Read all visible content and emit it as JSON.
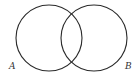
{
  "diagram": {
    "type": "venn",
    "sets": [
      {
        "label": "A",
        "cx": 49,
        "cy": 38,
        "r": 33,
        "label_x": 9,
        "label_y": 69
      },
      {
        "label": "B",
        "cx": 94,
        "cy": 38,
        "r": 33,
        "label_x": 125,
        "label_y": 69
      }
    ],
    "stroke_color": "#2a2a2a",
    "background": "#ffffff"
  }
}
